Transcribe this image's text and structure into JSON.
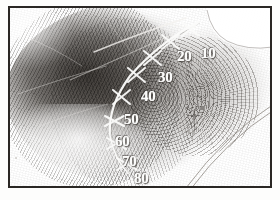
{
  "image": {
    "subject": "inked friction-ridge fingerprint impression on a card",
    "border_color": "#2a2724",
    "background_color": "#ffffff",
    "ink_color": "#1c1814",
    "annotation_color": "#fbfbfa"
  },
  "annotation": {
    "name": "ridge-count-scale",
    "description": "hand-drawn white arc with X-shaped tick marks numbered in tens",
    "labels": [
      {
        "value": "10",
        "x": 191,
        "y": 38
      },
      {
        "value": "20",
        "x": 167,
        "y": 41
      },
      {
        "value": "30",
        "x": 148,
        "y": 62
      },
      {
        "value": "40",
        "x": 131,
        "y": 81
      },
      {
        "value": "50",
        "x": 114,
        "y": 104
      },
      {
        "value": "60",
        "x": 105,
        "y": 126
      },
      {
        "value": "70",
        "x": 112,
        "y": 146
      },
      {
        "value": "80",
        "x": 124,
        "y": 163
      }
    ],
    "tick_marks": [
      {
        "name": "tick-10",
        "x": 180,
        "y": 21
      },
      {
        "name": "tick-20",
        "x": 160,
        "y": 34
      },
      {
        "name": "tick-30",
        "x": 142,
        "y": 50
      },
      {
        "name": "tick-40",
        "x": 126,
        "y": 67
      },
      {
        "name": "tick-50",
        "x": 111,
        "y": 89
      },
      {
        "name": "tick-60",
        "x": 104,
        "y": 113
      },
      {
        "name": "tick-70",
        "x": 106,
        "y": 136
      },
      {
        "name": "tick-80",
        "x": 117,
        "y": 157
      }
    ]
  },
  "marks": {
    "white_notch": "bright blank wedge at upper right of the print",
    "corner_lines": "two thin parallel curved lines crossing the lower right corner",
    "scratches": "pale diagonal scratches across the inked area"
  }
}
